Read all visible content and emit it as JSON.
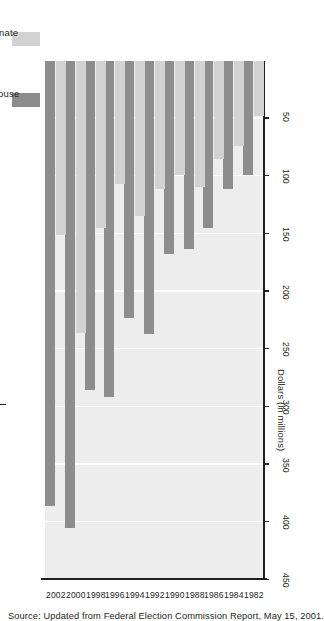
{
  "chart_data": {
    "type": "bar",
    "orientation": "horizontal",
    "title": "",
    "xlabel": "Dollars (in millions)",
    "ylabel": "",
    "categories": [
      "1982",
      "1984",
      "1986",
      "1988",
      "1990",
      "1992",
      "1994",
      "1996",
      "1998",
      "2000",
      "2002"
    ],
    "series": [
      {
        "name": "House",
        "color": "#8d8d8d",
        "values": [
          99,
          111,
          145,
          163,
          167,
          237,
          223,
          291,
          285,
          405,
          386
        ]
      },
      {
        "name": "Senate",
        "color": "#d2d2d2",
        "values": [
          48,
          74,
          85,
          109,
          99,
          111,
          134,
          107,
          145,
          236,
          151
        ]
      }
    ],
    "xticks": [
      450,
      400,
      350,
      300,
      250,
      200,
      150,
      100,
      50
    ],
    "xlim": [
      0,
      450
    ],
    "grid": true,
    "legend_position": "top-left",
    "plot_background": "#ededed"
  },
  "legend": {
    "items": [
      {
        "label": "House"
      },
      {
        "label": "Senate"
      }
    ]
  },
  "axis": {
    "title": "Dollars (in millions)",
    "ticks": [
      "450",
      "400",
      "350",
      "300",
      "250",
      "200",
      "150",
      "100",
      "50"
    ],
    "years": [
      "1982",
      "1984",
      "1986",
      "1988",
      "1990",
      "1992",
      "1994",
      "1996",
      "1998",
      "2000",
      "2002"
    ]
  },
  "footer": {
    "source": "Source: Updated from Federal Election Commission Report, May 15, 2001."
  },
  "colors": {
    "house": "#8d8d8d",
    "senate": "#d2d2d2",
    "plot_bg": "#ededed",
    "axis": "#231f20"
  }
}
